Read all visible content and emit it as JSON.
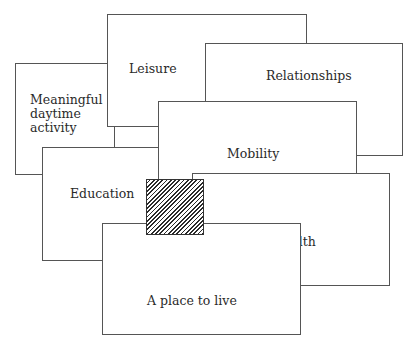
{
  "diagram": {
    "title": "",
    "boxes": [
      {
        "id": "meaningful",
        "label": "Meaningful\ndaytime\nactivity"
      },
      {
        "id": "leisure",
        "label": "Leisure"
      },
      {
        "id": "relationships",
        "label": "Relationships"
      },
      {
        "id": "education",
        "label": "Education"
      },
      {
        "id": "mobility",
        "label": "Mobility"
      },
      {
        "id": "place",
        "label": "A place to live"
      },
      {
        "id": "health",
        "label": "Health"
      }
    ],
    "center_overlap": {
      "pattern": "diagonal-hatch",
      "meaning": "area of overlap between all domains"
    }
  }
}
